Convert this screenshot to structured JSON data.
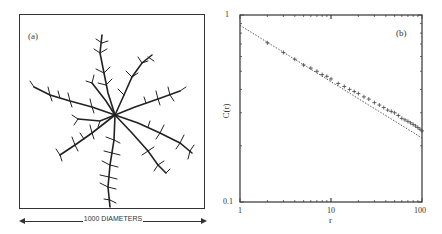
{
  "panel_a": {
    "label": "(a)",
    "scale_bar_text": "1000 DIAMETERS",
    "description": "Diffusion-limited aggregation cluster"
  },
  "panel_b": {
    "label": "(b)"
  },
  "chart_data": {
    "type": "scatter",
    "title": "",
    "panel_label": "(b)",
    "xlabel": "r",
    "ylabel": "C(r)",
    "xscale": "log",
    "yscale": "log",
    "xlim": [
      1,
      100
    ],
    "ylim": [
      0.1,
      1
    ],
    "x_tick_labels": [
      "1",
      "10",
      "100"
    ],
    "y_tick_labels": [
      "0.1",
      "1"
    ],
    "grid": false,
    "legend": null,
    "series": [
      {
        "name": "data",
        "marker": "+",
        "x": [
          2,
          3,
          4,
          5,
          6,
          7,
          8,
          9,
          10,
          12,
          14,
          16,
          18,
          20,
          23,
          26,
          30,
          34,
          38,
          42,
          46,
          50,
          55,
          60,
          65,
          70,
          75,
          80,
          85,
          90,
          95,
          100
        ],
        "y": [
          0.71,
          0.63,
          0.58,
          0.54,
          0.52,
          0.5,
          0.48,
          0.47,
          0.455,
          0.43,
          0.415,
          0.4,
          0.39,
          0.38,
          0.365,
          0.355,
          0.34,
          0.33,
          0.32,
          0.31,
          0.305,
          0.3,
          0.29,
          0.28,
          0.275,
          0.27,
          0.265,
          0.26,
          0.255,
          0.25,
          0.245,
          0.24
        ]
      },
      {
        "name": "fit",
        "style": "dotted-line",
        "x": [
          1,
          100
        ],
        "y": [
          0.88,
          0.22
        ]
      }
    ]
  }
}
